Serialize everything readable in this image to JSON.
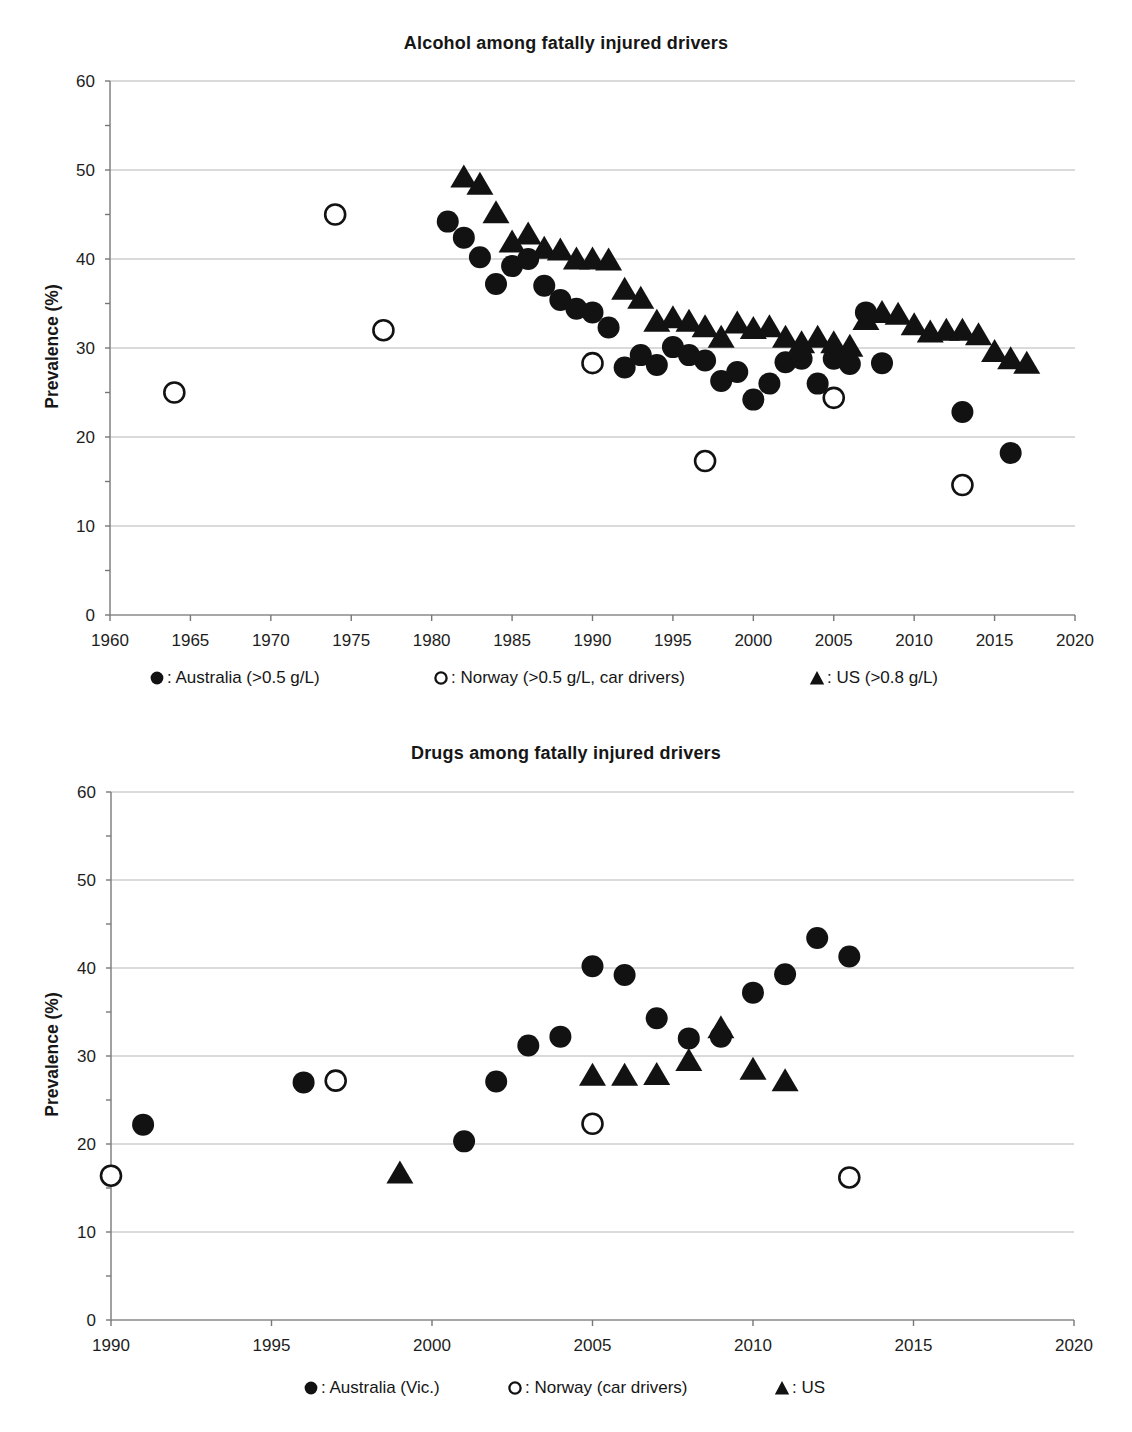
{
  "colors": {
    "marker": "#121212",
    "grid": "#a9a9a9",
    "axis": "#8a8a8a",
    "text": "#1d1d1d",
    "background": "#ffffff"
  },
  "chart_data": [
    {
      "type": "scatter",
      "title": "Alcohol among fatally injured drivers",
      "xlabel": "",
      "ylabel": "Prevalence (%)",
      "xlim": [
        1960,
        2020
      ],
      "ylim": [
        0,
        60
      ],
      "x_ticks": [
        1960,
        1965,
        1970,
        1975,
        1980,
        1985,
        1990,
        1995,
        2000,
        2005,
        2010,
        2015,
        2020
      ],
      "y_ticks": [
        0,
        10,
        20,
        30,
        40,
        50,
        60
      ],
      "grid": "horizontal",
      "legend_position": "bottom",
      "series": [
        {
          "name": "australia",
          "legend_label": ": Australia (>0.5 g/L)",
          "marker": "filled-circle",
          "points": [
            [
              1981,
              44.2
            ],
            [
              1982,
              42.4
            ],
            [
              1983,
              40.2
            ],
            [
              1984,
              37.2
            ],
            [
              1985,
              39.2
            ],
            [
              1986,
              40.0
            ],
            [
              1987,
              37.0
            ],
            [
              1988,
              35.4
            ],
            [
              1989,
              34.4
            ],
            [
              1990,
              34.0
            ],
            [
              1991,
              32.3
            ],
            [
              1992,
              27.8
            ],
            [
              1993,
              29.2
            ],
            [
              1994,
              28.1
            ],
            [
              1995,
              30.1
            ],
            [
              1996,
              29.2
            ],
            [
              1997,
              28.6
            ],
            [
              1998,
              26.3
            ],
            [
              1999,
              27.3
            ],
            [
              2000,
              24.2
            ],
            [
              2001,
              26.0
            ],
            [
              2002,
              28.4
            ],
            [
              2003,
              28.8
            ],
            [
              2004,
              26.0
            ],
            [
              2005,
              28.8
            ],
            [
              2006,
              28.2
            ],
            [
              2007,
              34.0
            ],
            [
              2008,
              28.3
            ],
            [
              2013,
              22.8
            ],
            [
              2016,
              18.2
            ]
          ]
        },
        {
          "name": "norway",
          "legend_label": ": Norway (>0.5 g/L, car drivers)",
          "marker": "open-circle",
          "points": [
            [
              1964,
              25.0
            ],
            [
              1974,
              45.0
            ],
            [
              1977,
              32.0
            ],
            [
              1990,
              28.3
            ],
            [
              1997,
              17.3
            ],
            [
              2005,
              24.4
            ],
            [
              2013,
              14.6
            ]
          ]
        },
        {
          "name": "us",
          "legend_label": ": US (>0.8 g/L)",
          "marker": "filled-triangle",
          "points": [
            [
              1982,
              49.2
            ],
            [
              1983,
              48.4
            ],
            [
              1984,
              45.2
            ],
            [
              1985,
              41.9
            ],
            [
              1986,
              42.8
            ],
            [
              1987,
              41.2
            ],
            [
              1988,
              41.0
            ],
            [
              1989,
              40.0
            ],
            [
              1990,
              40.0
            ],
            [
              1991,
              39.9
            ],
            [
              1992,
              36.6
            ],
            [
              1993,
              35.6
            ],
            [
              1994,
              33.0
            ],
            [
              1995,
              33.4
            ],
            [
              1996,
              33.0
            ],
            [
              1997,
              32.4
            ],
            [
              1998,
              31.2
            ],
            [
              1999,
              32.8
            ],
            [
              2000,
              32.2
            ],
            [
              2001,
              32.4
            ],
            [
              2002,
              31.2
            ],
            [
              2003,
              30.6
            ],
            [
              2004,
              31.2
            ],
            [
              2005,
              30.6
            ],
            [
              2006,
              30.2
            ],
            [
              2007,
              33.2
            ],
            [
              2008,
              34.0
            ],
            [
              2009,
              33.8
            ],
            [
              2010,
              32.6
            ],
            [
              2011,
              31.8
            ],
            [
              2012,
              32.0
            ],
            [
              2013,
              32.0
            ],
            [
              2014,
              31.5
            ],
            [
              2015,
              29.6
            ],
            [
              2016,
              28.8
            ],
            [
              2017,
              28.3
            ]
          ]
        }
      ]
    },
    {
      "type": "scatter",
      "title": "Drugs among fatally injured drivers",
      "xlabel": "",
      "ylabel": "Prevalence (%)",
      "xlim": [
        1990,
        2020
      ],
      "ylim": [
        0,
        60
      ],
      "x_ticks": [
        1990,
        1995,
        2000,
        2005,
        2010,
        2015,
        2020
      ],
      "y_ticks": [
        0,
        10,
        20,
        30,
        40,
        50,
        60
      ],
      "grid": "horizontal",
      "legend_position": "bottom",
      "series": [
        {
          "name": "australia",
          "legend_label": ": Australia (Vic.)",
          "marker": "filled-circle",
          "points": [
            [
              1991,
              22.2
            ],
            [
              1996,
              27.0
            ],
            [
              2001,
              20.3
            ],
            [
              2002,
              27.1
            ],
            [
              2003,
              31.2
            ],
            [
              2004,
              32.2
            ],
            [
              2005,
              40.2
            ],
            [
              2006,
              39.2
            ],
            [
              2007,
              34.3
            ],
            [
              2008,
              32.0
            ],
            [
              2009,
              32.2
            ],
            [
              2010,
              37.2
            ],
            [
              2011,
              39.3
            ],
            [
              2012,
              43.4
            ],
            [
              2013,
              41.3
            ]
          ]
        },
        {
          "name": "norway",
          "legend_label": ": Norway (car drivers)",
          "marker": "open-circle",
          "points": [
            [
              1990,
              16.4
            ],
            [
              1997,
              27.2
            ],
            [
              2005,
              22.3
            ],
            [
              2013,
              16.2
            ]
          ]
        },
        {
          "name": "us",
          "legend_label": ": US",
          "marker": "filled-triangle",
          "points": [
            [
              1999,
              16.7
            ],
            [
              2005,
              27.8
            ],
            [
              2006,
              27.8
            ],
            [
              2007,
              27.9
            ],
            [
              2008,
              29.5
            ],
            [
              2009,
              33.2
            ],
            [
              2010,
              28.5
            ],
            [
              2011,
              27.2
            ]
          ]
        }
      ]
    }
  ]
}
